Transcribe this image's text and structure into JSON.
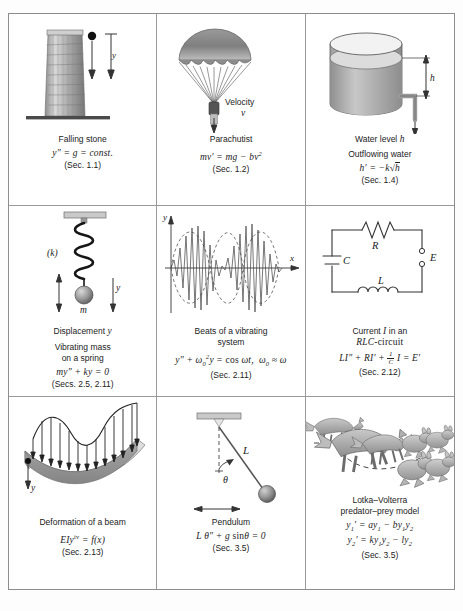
{
  "figure": {
    "cells": [
      {
        "id": "falling-stone",
        "labels": {
          "y": "y"
        },
        "title": "Falling stone",
        "equation": "y″ = g = const.",
        "section": "(Sec. 1.1)"
      },
      {
        "id": "parachutist",
        "labels": {
          "velocity": "Velocity",
          "v": "v"
        },
        "title": "Parachutist",
        "equation": "mv′ = mg − bv²",
        "section": "(Sec. 1.2)"
      },
      {
        "id": "outflowing-water",
        "labels": {
          "h": "h"
        },
        "title": "Water level h",
        "subtitle": "Outflowing water",
        "equation": "h′ = −k √h",
        "section": "(Sec. 1.4)"
      },
      {
        "id": "vibrating-mass",
        "labels": {
          "k": "(k)",
          "m": "m",
          "y": "y"
        },
        "title": "Displacement y",
        "subtitle": "Vibrating mass\non a spring",
        "equation": "my″ + ky = 0",
        "section": "(Secs. 2.5, 2.11)"
      },
      {
        "id": "beats",
        "labels": {
          "x": "x",
          "y": "y"
        },
        "title": "Beats of a vibrating\nsystem",
        "equation": "y″ + ω₀²y = cos ωt,   ω₀ ≈ ω",
        "section": "(Sec. 2.11)"
      },
      {
        "id": "rlc-circuit",
        "labels": {
          "R": "R",
          "C": "C",
          "L": "L",
          "E": "E"
        },
        "title": "Current I in an",
        "subtitle": "RLC-circuit",
        "equation": "LI″ + RI′ + (1/C)I = E′",
        "section": "(Sec. 2.12)"
      },
      {
        "id": "beam-deformation",
        "labels": {
          "y": "y"
        },
        "title": "Deformation of a beam",
        "equation": "EIy⁴ = f(x)",
        "section": "(Sec. 2.13)"
      },
      {
        "id": "pendulum",
        "labels": {
          "L": "L",
          "theta": "θ"
        },
        "title": "Pendulum",
        "equation": "L θ″ + g sinθ = 0",
        "section": "(Sec. 3.5)"
      },
      {
        "id": "lotka-volterra",
        "title": "Lotka–Volterra",
        "subtitle": "predator–prey model",
        "equation1": "y₁′ = ay₁ − by₁y₂",
        "equation2": "y₂′ = ky₁y₂ − ly₂",
        "section": "(Sec. 3.5)"
      }
    ]
  },
  "colors": {
    "border": "#9a9a9a",
    "ink": "#222222",
    "gray_fill": "#b9b9b9",
    "water": "#c8c8c8",
    "stone": "#111111"
  }
}
